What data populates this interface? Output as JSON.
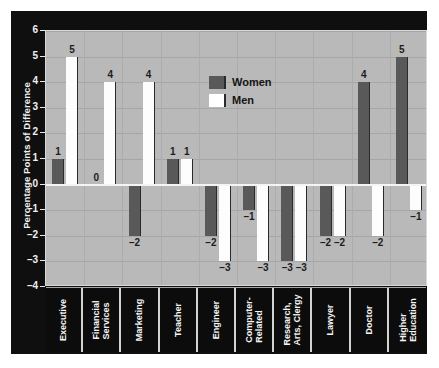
{
  "chart_data": {
    "type": "bar",
    "title": "",
    "xlabel": "",
    "ylabel": "Percentage Points of Difference",
    "ylim": [
      -4,
      6
    ],
    "yticks": [
      6,
      5,
      4,
      3,
      2,
      1,
      0,
      -1,
      -2,
      -3,
      -4
    ],
    "ytick_labels": [
      "6",
      "5",
      "4",
      "3",
      "2",
      "1",
      "0",
      "–1",
      "–2",
      "–3",
      "–4"
    ],
    "grid": true,
    "legend_position": "top-center",
    "categories": [
      "Executive",
      "Financial Services",
      "Marketing",
      "Teacher",
      "Engineer",
      "Computer-Related",
      "Research, Arts, Clergy",
      "Lawyer",
      "Doctor",
      "Higher Education"
    ],
    "category_lines": [
      [
        "Executive"
      ],
      [
        "Financial",
        "Services"
      ],
      [
        "Marketing"
      ],
      [
        "Teacher"
      ],
      [
        "Engineer"
      ],
      [
        "Computer-",
        "Related"
      ],
      [
        "Research,",
        "Arts, Clergy"
      ],
      [
        "Lawyer"
      ],
      [
        "Doctor"
      ],
      [
        "Higher",
        "Education"
      ]
    ],
    "series": [
      {
        "name": "Women",
        "color": "#595959",
        "values": [
          1,
          0,
          -2,
          1,
          -2,
          -1,
          -3,
          -2,
          4,
          5
        ],
        "labels": [
          "1",
          "0",
          "–2",
          "1",
          "–2",
          "–1",
          "–3",
          "–2",
          "4",
          "5"
        ]
      },
      {
        "name": "Men",
        "color": "#ffffff",
        "values": [
          5,
          4,
          4,
          1,
          -3,
          -3,
          -3,
          -2,
          -2,
          -1
        ],
        "labels": [
          "5",
          "4",
          "4",
          "1",
          "–3",
          "–3",
          "–3",
          "–2",
          "–2",
          "–1"
        ]
      }
    ]
  },
  "legend": {
    "items": [
      {
        "label": "Women",
        "swatch": "women"
      },
      {
        "label": "Men",
        "swatch": "men"
      }
    ]
  },
  "axis": {
    "y_title": "Percentage Points of Difference"
  }
}
